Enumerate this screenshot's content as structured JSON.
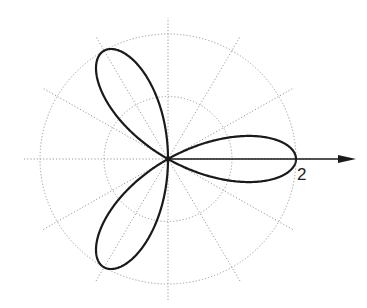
{
  "chart_data": {
    "type": "line",
    "subtype": "polar",
    "title": "",
    "equation": "r = 2cos(3θ)",
    "curve": {
      "name": "three-leaf rose",
      "amplitude": 2,
      "petals": 3,
      "petal_angles_deg": [
        0,
        120,
        240
      ]
    },
    "radial_grid": [
      1,
      2
    ],
    "angular_grid_step_deg": 30,
    "axis": {
      "direction": "positive x",
      "arrow": true
    },
    "tick_labels": [
      {
        "value": 2,
        "text": "2"
      }
    ],
    "grid": true,
    "legend": null,
    "colors": {
      "curve": "#1a1a1a",
      "grid": "#9a9a9a",
      "axis": "#1a1a1a"
    }
  },
  "labels": {
    "r_max": "2"
  }
}
